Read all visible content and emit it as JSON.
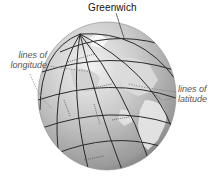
{
  "diagram": {
    "labels": {
      "greenwich": "Greenwich",
      "longitude_line1": "lines of",
      "longitude_line2": "longitude",
      "latitude_line1": "lines of",
      "latitude_line2": "latitude"
    },
    "colors": {
      "globe_light": "#e6e6e6",
      "globe_mid": "#b9b9b9",
      "globe_dark": "#7d7d7d",
      "land": "#d2d2d2",
      "grid_line": "#2a2a2a",
      "leader_line": "#7a7a7a",
      "text": "#111111",
      "italic_text": "#555555"
    },
    "globe": {
      "center_x": 107,
      "center_y": 96,
      "radius_x": 69,
      "radius_y": 74,
      "north_pole": [
        80,
        34
      ]
    }
  }
}
